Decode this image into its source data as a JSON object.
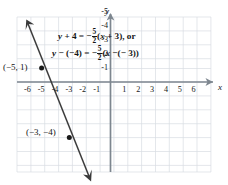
{
  "figure": {
    "name": "coordinate-plane-line-graph",
    "background": "#ffffff",
    "grid_color": "#d9dde3",
    "axis_color": "#808a93",
    "line_color": "#3a3a3a",
    "text_color": "#151515"
  },
  "axes": {
    "x_label": "x",
    "y_label": "y",
    "x_ticks": [
      "-6",
      "-5",
      "-4",
      "-3",
      "-2",
      "-1",
      "1",
      "2",
      "3",
      "4",
      "5",
      "6"
    ],
    "y_ticks": [
      "-1",
      "-2",
      "-3",
      "-4",
      "-5",
      "-6"
    ],
    "x_range": [
      -7,
      7
    ],
    "y_range": [
      -7,
      2
    ],
    "grid": true
  },
  "equations": {
    "line_1": {
      "lhs_y": "y",
      "lhs_rest": " + 4 = −",
      "frac_num": "5",
      "frac_den": "2",
      "rhs_open": "(",
      "rhs_x": "x",
      "rhs_close": " + 3), or",
      "plain": "y + 4 = -5/2(x + 3), or"
    },
    "line_2": {
      "lhs_y": "y",
      "lhs_rest": " − (−4) = −",
      "frac_num": "5",
      "frac_den": "2",
      "rhs_open": "(",
      "rhs_x": "x",
      "rhs_close": " −(− 3))",
      "plain": "y - (-4) = -5/2(x -(- 3))"
    }
  },
  "points": [
    {
      "label": "(−5, 1)",
      "x": -5,
      "y": 1
    },
    {
      "label": "(−3, −4)",
      "x": -3,
      "y": -4
    }
  ],
  "chart_data": {
    "type": "line",
    "title": "",
    "xlabel": "x",
    "ylabel": "y",
    "xlim": [
      -7,
      7
    ],
    "ylim": [
      -7,
      2
    ],
    "grid": true,
    "slope": -2.5,
    "series": [
      {
        "name": "y + 4 = -5/2(x + 3)",
        "x": [
          -6.3,
          -1.5
        ],
        "y": [
          4.25,
          -7.75
        ],
        "marked_points": [
          {
            "x": -5,
            "y": 1
          },
          {
            "x": -3,
            "y": -4
          }
        ]
      }
    ],
    "annotations": [
      "y + 4 = -5/2(x + 3), or",
      "y - (-4) = -5/2(x -(- 3))",
      "(-5, 1)",
      "(-3, -4)"
    ]
  }
}
